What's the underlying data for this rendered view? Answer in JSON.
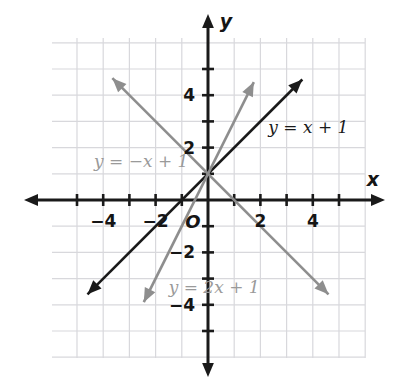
{
  "figure": {
    "kind": "coordinate-plane-line-graph",
    "background_color": "#ffffff",
    "grid_color": "#d8d8dc",
    "axis_color": "#1a1a1a",
    "origin_label": "O",
    "x_axis_name": "x",
    "y_axis_name": "y"
  },
  "chart_data": {
    "type": "line",
    "title": "",
    "subtitle": "",
    "xlabel": "x",
    "ylabel": "y",
    "xlim": [
      -5,
      5
    ],
    "ylim": [
      -5,
      5
    ],
    "grid": true,
    "grid_step": 1,
    "legend_position": "inline-labels",
    "x_ticks": [
      -4,
      -2,
      2,
      4
    ],
    "y_ticks": [
      4,
      2,
      -2,
      -4
    ],
    "x_tick_labels": [
      "−4",
      "−2",
      "2",
      "4"
    ],
    "y_tick_labels": [
      "4",
      "2",
      "−2",
      "−4"
    ],
    "annotations": [
      {
        "text": "O",
        "x": -0.35,
        "y": -0.55,
        "role": "origin"
      }
    ],
    "series": [
      {
        "name": "y = x + 1",
        "label": "y = x + 1",
        "equation": "y = x + 1",
        "slope": 1,
        "intercept": 1,
        "color": "#1a1a1a",
        "label_color": "#1a1a1a",
        "label_x": 2.3,
        "label_y": 2.75,
        "x": [
          -4.6,
          3.6
        ],
        "values": [
          -3.6,
          4.6
        ],
        "arrow_start": true,
        "arrow_end": true
      },
      {
        "name": "y = 2x + 1",
        "label": "y = 2x + 1",
        "equation": "y = 2x + 1",
        "slope": 2,
        "intercept": 1,
        "color": "#8e8e8e",
        "label_color": "#9a9a9a",
        "label_x": -1.5,
        "label_y": -3.35,
        "x": [
          -2.45,
          1.75
        ],
        "values": [
          -3.9,
          4.5
        ],
        "arrow_start": true,
        "arrow_end": true
      },
      {
        "name": "y = -x + 1",
        "label": "y = −x + 1",
        "equation": "y = −x + 1",
        "slope": -1,
        "intercept": 1,
        "color": "#8e8e8e",
        "label_color": "#9a9a9a",
        "label_x": -4.35,
        "label_y": 1.45,
        "x": [
          -3.65,
          4.6
        ],
        "values": [
          4.65,
          -3.6
        ],
        "arrow_start": true,
        "arrow_end": true
      }
    ]
  }
}
